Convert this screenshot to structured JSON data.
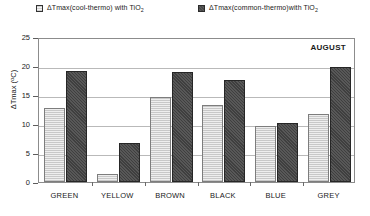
{
  "chart_data": {
    "type": "bar",
    "title": "",
    "annotation": "AUGUST",
    "xlabel": "",
    "ylabel": "ΔTmax (°C)",
    "ylim": [
      0,
      25
    ],
    "ytick_step": 5,
    "yticks": [
      0,
      5,
      10,
      15,
      20,
      25
    ],
    "grid": true,
    "legend_position": "top",
    "categories": [
      "GREEN",
      "YELLOW",
      "BROWN",
      "BLACK",
      "BLUE",
      "GREY"
    ],
    "series": [
      {
        "name": "ΔTmax(cool-thermo) with TiO2",
        "name_base": "ΔTmax(cool-thermo) with TiO",
        "name_sub": "2",
        "swatch": "light",
        "values": [
          12.8,
          1.3,
          14.7,
          13.3,
          9.6,
          11.8
        ]
      },
      {
        "name": "ΔTmax(common-thermo)with TiO2",
        "name_base": "ΔTmax(common-thermo)with TiO",
        "name_sub": "2",
        "swatch": "dark",
        "values": [
          19.2,
          6.8,
          18.9,
          17.6,
          10.1,
          19.9
        ]
      }
    ]
  },
  "colors": {
    "series_light_fill": "#e4e4e4",
    "series_light_edge": "#7d7d7d",
    "series_dark_fill": "#4a4a4a",
    "series_dark_edge": "#262626",
    "grid": "#b9b9b9",
    "frame": "#8c8c8c",
    "text": "#1a1a1a"
  }
}
